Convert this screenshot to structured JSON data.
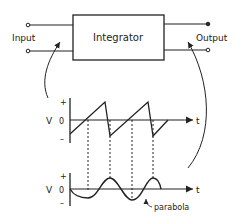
{
  "diagram": {
    "block": {
      "label": "Integrator"
    },
    "input": {
      "label": "Input"
    },
    "output": {
      "label": "Output"
    },
    "top_graph": {
      "y_label": "V",
      "plus": "+",
      "zero": "0",
      "minus": "–",
      "x_label": "t",
      "waveform": "sawtooth"
    },
    "bottom_graph": {
      "y_label": "V",
      "plus": "+",
      "zero": "0",
      "minus": "–",
      "x_label": "t",
      "waveform": "parabolic"
    },
    "annotation": {
      "label": "parabola"
    },
    "colors": {
      "ink": "#222222",
      "background": "#ffffff"
    }
  }
}
